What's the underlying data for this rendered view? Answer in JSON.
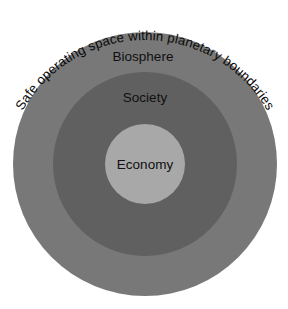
{
  "diagram": {
    "type": "nested-circles",
    "title": "Safe operating space within planetary boundaries",
    "background_color": "#ffffff",
    "arc_text": "Safe operating space within planetary boundaries",
    "center": {
      "x": 145,
      "y": 164
    },
    "rings": [
      {
        "id": "biosphere",
        "label": "Biosphere",
        "level": 1,
        "color": "#787878",
        "radius": 132,
        "label_x": 143,
        "label_y": 57
      },
      {
        "id": "society",
        "label": "Society",
        "level": 2,
        "color": "#606060",
        "radius": 92,
        "label_x": 145,
        "label_y": 98
      },
      {
        "id": "economy",
        "label": "Economy",
        "level": 3,
        "color": "#a8a8a8",
        "radius": 40,
        "label_x": 145,
        "label_y": 165
      }
    ],
    "text_color": "#101010"
  }
}
